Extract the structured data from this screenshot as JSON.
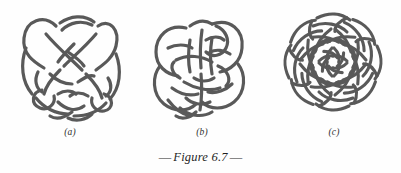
{
  "figure": {
    "caption_prefix": "—",
    "caption_text": "Figure 6.7",
    "caption_suffix": "—",
    "caption_full": "— Figure 6.7 —",
    "background_color": "#fefefe",
    "stroke_color": "#595959",
    "stroke_width": 3,
    "label_color": "#2e2e2e"
  },
  "panels": [
    {
      "id": "a",
      "label": "(a)",
      "name": "knot-diagram-a",
      "description": "Interlaced knot diagram, rounded trefoil-like composition with multiple over-under crossings",
      "crossings": 10,
      "symmetry": "2-fold",
      "bounds": {
        "x": 20,
        "y": 8,
        "width": 96,
        "height": 115
      }
    },
    {
      "id": "b",
      "label": "(b)",
      "name": "knot-diagram-b",
      "description": "Interlaced knot diagram, vertically elongated loop composition with central strands",
      "crossings": 10,
      "symmetry": "2-fold",
      "bounds": {
        "x": 152,
        "y": 8,
        "width": 92,
        "height": 115
      }
    },
    {
      "id": "c",
      "label": "(c)",
      "name": "knot-diagram-c",
      "description": "Circular rosette knot with eightfold radial symmetry and scalloped outer petals",
      "crossings": 24,
      "symmetry": "8-fold radial",
      "bounds": {
        "x": 285,
        "y": 14,
        "width": 94,
        "height": 96
      }
    }
  ]
}
